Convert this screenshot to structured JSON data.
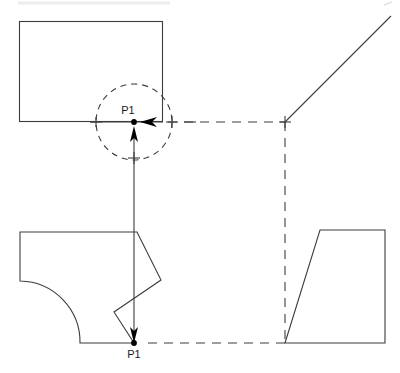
{
  "drawing": {
    "title": "CAD sketch constraint view",
    "canvas": {
      "width": 400,
      "height": 373,
      "background": "#ffffff"
    },
    "colors": {
      "solid_line": "#3c3c3c",
      "dashed_construction": "#3c3c3c",
      "point_marker": "#000000",
      "label_text": "#1a1a1a",
      "faint_artifact": "#e8e8e8"
    },
    "labels": {
      "point_upper": "P1",
      "point_lower": "P1"
    },
    "points": [
      {
        "name": "P1-upper",
        "label": "P1",
        "x": 134,
        "y": 122
      },
      {
        "name": "P1-lower",
        "label": "P1",
        "x": 134,
        "y": 343
      }
    ],
    "shapes": [
      {
        "name": "top-left-rectangle",
        "kind": "rectangle",
        "x": 19,
        "y": 21,
        "width": 144,
        "height": 101,
        "style": "solid"
      },
      {
        "name": "bottom-left-profile",
        "kind": "polyline-with-arc",
        "style": "solid",
        "vertices": [
          [
            20,
            232
          ],
          [
            137,
            232
          ],
          [
            161,
            280
          ],
          [
            114,
            312
          ],
          [
            134,
            343
          ],
          [
            80,
            343
          ]
        ],
        "arc": {
          "from": [
            80,
            343
          ],
          "to": [
            20,
            281
          ],
          "radius": 61
        },
        "close_to": [
          20,
          232
        ]
      },
      {
        "name": "bottom-right-trapezoid",
        "kind": "polygon",
        "style": "solid",
        "vertices": [
          [
            285,
            343
          ],
          [
            320,
            230
          ],
          [
            385,
            230
          ],
          [
            385,
            343
          ]
        ]
      },
      {
        "name": "upper-right-diagonal",
        "kind": "line",
        "style": "solid",
        "from": [
          285,
          122
        ],
        "to": [
          390,
          17
        ]
      }
    ],
    "construction_lines": [
      {
        "name": "horizontal-construction-top",
        "kind": "dashed-line",
        "from": [
          163,
          122
        ],
        "to": [
          285,
          122
        ]
      },
      {
        "name": "vertical-construction-right",
        "kind": "dashed-line",
        "from": [
          285,
          122
        ],
        "to": [
          285,
          343
        ]
      },
      {
        "name": "horizontal-construction-bottom",
        "kind": "dashed-line",
        "from": [
          150,
          343
        ],
        "to": [
          285,
          343
        ]
      },
      {
        "name": "selection-circle",
        "kind": "dashed-circle",
        "center": [
          134,
          122
        ],
        "radius": 38
      }
    ],
    "annotations": [
      {
        "name": "arrow-up-to-p1",
        "kind": "arrow",
        "direction": "up",
        "from": [
          134,
          343
        ],
        "to": [
          134,
          126
        ]
      },
      {
        "name": "arrow-left-to-p1",
        "kind": "arrow",
        "direction": "left",
        "from": [
          178,
          122
        ],
        "to": [
          140,
          122
        ]
      },
      {
        "name": "crosshair-right-of-p1",
        "kind": "crosshair",
        "x": 172,
        "y": 122
      },
      {
        "name": "crosshair-left-of-p1",
        "kind": "crosshair",
        "x": 96,
        "y": 122
      },
      {
        "name": "crosshair-below-p1",
        "kind": "crosshair",
        "x": 134,
        "y": 158
      },
      {
        "name": "crosshair-corner-right",
        "kind": "crosshair",
        "x": 285,
        "y": 122
      },
      {
        "name": "tick-far-right-of-p1",
        "kind": "tick",
        "x": 190,
        "y": 122
      },
      {
        "name": "horizontal-lead-line",
        "kind": "line",
        "from": [
          90,
          122
        ],
        "to": [
          163,
          122
        ]
      }
    ]
  }
}
